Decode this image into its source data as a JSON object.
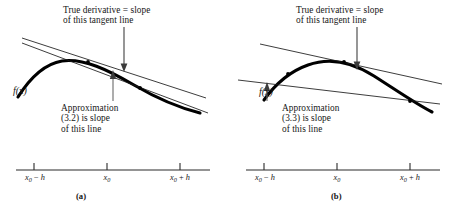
{
  "figure": {
    "panels": [
      {
        "id": "a",
        "caption": "(a)",
        "curve_label": "f(x)",
        "annotations": {
          "tangent": {
            "line1": "True derivative = slope",
            "line2": "of this tangent line"
          },
          "approximation": {
            "line1": "Approximation",
            "line2": "(3.2) is slope",
            "line3": "of this line"
          }
        },
        "axis": {
          "ticks": [
            {
              "base": "x",
              "sub": "0",
              "op": " − ",
              "term": "h",
              "text": "x0 − h"
            },
            {
              "base": "x",
              "sub": "0",
              "op": "",
              "term": "",
              "text": "x0"
            },
            {
              "base": "x",
              "sub": "0",
              "op": " + ",
              "term": "h",
              "text": "x0 + h"
            }
          ]
        }
      },
      {
        "id": "b",
        "caption": "(b)",
        "curve_label": "f(x)",
        "annotations": {
          "tangent": {
            "line1": "True derivative = slope",
            "line2": "of this tangent line"
          },
          "approximation": {
            "line1": "Approximation",
            "line2": "(3.3) is slope",
            "line3": "of this line"
          }
        },
        "axis": {
          "ticks": [
            {
              "base": "x",
              "sub": "0",
              "op": " − ",
              "term": "h",
              "text": "x0 − h"
            },
            {
              "base": "x",
              "sub": "0",
              "op": "",
              "term": "",
              "text": "x0"
            },
            {
              "base": "x",
              "sub": "0",
              "op": " + ",
              "term": "h",
              "text": "x0 + h"
            }
          ]
        }
      }
    ],
    "colors": {
      "curve": "#000000",
      "line": "#1a1a1a",
      "arrow": "#4a4a4a",
      "axis": "#2a2a2a",
      "background": "#ffffff"
    }
  }
}
